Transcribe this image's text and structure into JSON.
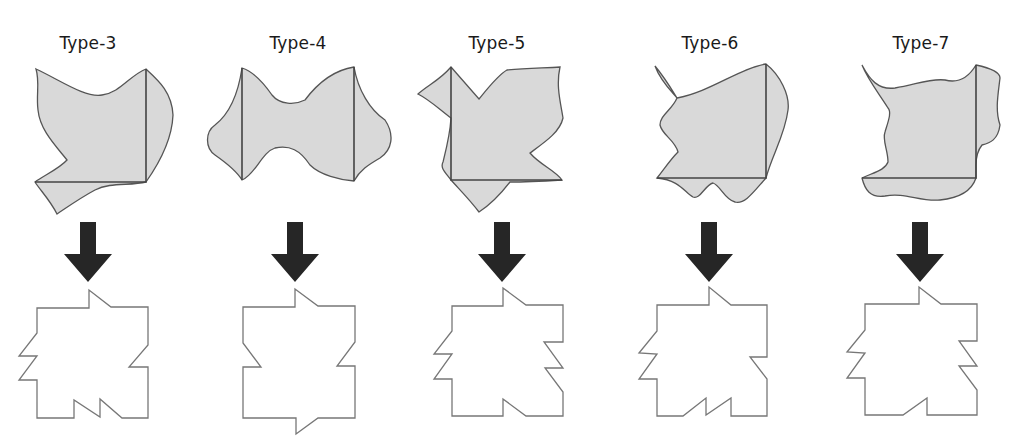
{
  "figure": {
    "columns": [
      {
        "label": "Type-3",
        "label_x": 88,
        "label_y": 33,
        "top_blob_path": "M36,69 C60,80 85,98 102,95 C120,93 130,75 146,69 C158,80 172,92 173,115 C172,140 158,165 146,182 C130,186 110,182 95,190 C80,198 66,208 57,214 C50,200 40,190 35,182 C45,175 60,168 67,160 C55,145 40,130 38,110 C36,95 40,82 36,69 Z",
        "top_square_edges": "M146,69 L146,182 L35,182",
        "arrow": {
          "cx": 88,
          "shaft_top": 222,
          "head_top": 254,
          "tip": 282,
          "shaft_half": 8,
          "head_half": 24
        },
        "bottom_outline_points": "37,308 89,308 89,290 111,307 148,307 148,345 129,367 148,367 148,418 122,418 100,399 100,417 74,400 74,418 37,418 37,380 19,380 37,356 19,356 37,333"
      },
      {
        "label": "Type-4",
        "label_x": 298,
        "label_y": 33,
        "top_blob_path": "M242,68 C255,72 265,85 272,95 C280,105 295,105 305,100 C320,80 335,70 354,67 C358,90 370,110 385,120 C395,135 392,150 380,158 C368,165 360,170 354,181 C340,180 320,175 310,165 C300,150 290,145 275,148 C262,152 255,175 242,180 C236,170 225,162 215,155 C205,148 205,132 215,125 C228,115 238,95 242,68 Z",
        "top_square_edges": "M242,68 L242,180 M354,67 L354,181",
        "arrow": {
          "cx": 295,
          "shaft_top": 222,
          "head_top": 254,
          "tip": 282,
          "shaft_half": 8,
          "head_half": 24
        },
        "bottom_outline_points": "243,307 295,307 295,289 318,306 355,306 355,342 337,366 355,366 355,418 318,418 296,434 296,418 243,418 243,367 261,367 243,343"
      },
      {
        "label": "Type-5",
        "label_x": 497,
        "label_y": 33,
        "top_blob_path": "M451,67 L479,99 C488,88 498,75 507,70 C525,68 545,68 560,67 C556,85 560,100 563,118 C560,132 545,142 530,153 C540,165 555,170 562,180 C545,181 525,182 510,182 C500,195 490,205 479,212 C470,200 460,190 451,180 C445,172 440,168 443,162 C446,150 450,135 451,118 C440,110 430,100 418,94 C428,85 440,80 451,67 Z",
        "top_square_edges": "M451,67 L451,180 L562,180",
        "arrow": {
          "cx": 502,
          "shaft_top": 222,
          "head_top": 254,
          "tip": 282,
          "shaft_half": 8,
          "head_half": 24
        },
        "bottom_outline_points": "452,306 503,306 503,288 526,305 563,305 563,342 544,342 563,368 545,368 563,392 563,416 526,416 503,399 503,416 452,416 452,379 434,379 452,354 434,354 452,331"
      },
      {
        "label": "Type-6",
        "label_x": 710,
        "label_y": 33,
        "top_blob_path": "M655,66 C665,78 672,90 677,98 C710,92 740,68 766,64 C780,75 790,95 788,110 C785,135 772,155 766,178 C755,190 745,205 735,202 C725,200 720,185 713,183 C705,185 700,200 693,197 C685,193 680,180 657,178 C665,168 670,160 678,152 C675,140 662,135 660,125 C660,115 672,110 677,98 C670,90 660,80 655,66 Z",
        "top_square_edges": "M766,64 L766,178 L657,178",
        "arrow": {
          "cx": 709,
          "shaft_top": 222,
          "head_top": 254,
          "tip": 282,
          "shaft_half": 8,
          "head_half": 24
        },
        "bottom_outline_points": "657,305 709,305 709,287 731,305 767,305 767,357 750,357 767,379 767,416 731,416 731,398 706,415 706,398 683,416 657,416 657,379 639,379 657,354 639,353 657,331"
      },
      {
        "label": "Type-7",
        "label_x": 921,
        "label_y": 33,
        "top_blob_path": "M862,65 C870,80 878,90 895,88 C915,85 930,78 945,80 C960,84 970,75 976,65 C990,68 1000,72 1000,78 C998,95 995,110 1000,125 C998,140 990,143 982,145 C978,150 976,155 976,165 L976,178 C972,190 960,198 940,200 C920,202 905,192 885,196 C870,198 865,190 862,178 C875,172 885,170 888,162 C888,150 882,140 885,132 C888,122 892,112 888,108 C880,95 868,80 862,65 Z",
        "top_square_edges": "M976,65 L976,178 L862,178",
        "arrow": {
          "cx": 920,
          "shaft_top": 222,
          "head_top": 254,
          "tip": 282,
          "shaft_half": 8,
          "head_half": 24
        },
        "bottom_outline_points": "865,304 919,304 919,287 941,304 977,304 977,341 959,341 977,366 959,366 977,390 977,415 927,415 927,398 903,415 865,415 865,378 847,378 865,353 847,352 865,330"
      }
    ],
    "colors": {
      "blob_fill": "#d9d9d9",
      "blob_stroke": "#555555",
      "arrow_fill": "#262626",
      "outline_stroke": "#777777",
      "background": "#ffffff"
    }
  }
}
